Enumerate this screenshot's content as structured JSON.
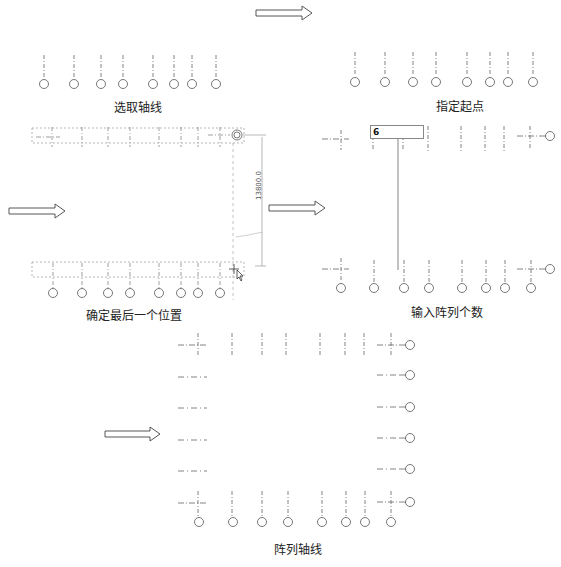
{
  "steps": [
    {
      "id": "select-grid",
      "caption": "选取轴线"
    },
    {
      "id": "specify-start",
      "caption": "指定起点"
    },
    {
      "id": "determine-last-position",
      "caption": "确定最后一个位置",
      "dimension": "13800.0"
    },
    {
      "id": "enter-array-count",
      "caption": "输入阵列个数",
      "input_value": "6"
    },
    {
      "id": "array-grid",
      "caption": "阵列轴线"
    }
  ],
  "vertical_grid_labels": [
    "1",
    "2",
    "3",
    "4",
    "5",
    "6",
    "7",
    "8"
  ],
  "horizontal_grid_labels": [
    "9",
    "11",
    "12",
    "13",
    "14",
    "15"
  ],
  "arrows": [
    "right-arrow",
    "right-arrow",
    "right-arrow",
    "right-arrow"
  ],
  "colors": {
    "line": "#555555",
    "dash": "#888888",
    "selection": "#999999"
  }
}
